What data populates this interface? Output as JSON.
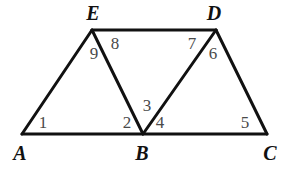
{
  "figure": {
    "background_color": "#ffffff",
    "stroke_color": "#111111",
    "stroke_width": 3,
    "vertex_label_color": "#111111",
    "angle_label_color": "#4a4a4a",
    "width": 285,
    "height": 172
  },
  "chart_data": {
    "type": "diagram",
    "shape": "two-triangles-trapezoid",
    "points": {
      "A": {
        "x": 22,
        "y": 134
      },
      "B": {
        "x": 143,
        "y": 134
      },
      "C": {
        "x": 267,
        "y": 134
      },
      "D": {
        "x": 216,
        "y": 30
      },
      "E": {
        "x": 92,
        "y": 30
      }
    },
    "segments": [
      {
        "name": "AC",
        "from": "A",
        "to": "C"
      },
      {
        "name": "ED",
        "from": "E",
        "to": "D"
      },
      {
        "name": "AE",
        "from": "A",
        "to": "E"
      },
      {
        "name": "EB",
        "from": "E",
        "to": "B"
      },
      {
        "name": "BD",
        "from": "B",
        "to": "D"
      },
      {
        "name": "DC",
        "from": "D",
        "to": "C"
      }
    ],
    "triangles": [
      {
        "name": "AEB",
        "vertices": [
          "A",
          "E",
          "B"
        ]
      },
      {
        "name": "BDC",
        "vertices": [
          "B",
          "D",
          "C"
        ]
      }
    ]
  },
  "vertices": [
    {
      "id": "A",
      "label": "A",
      "x": 20,
      "y": 153
    },
    {
      "id": "B",
      "label": "B",
      "x": 142,
      "y": 153
    },
    {
      "id": "C",
      "label": "C",
      "x": 270,
      "y": 153
    },
    {
      "id": "D",
      "label": "D",
      "x": 214,
      "y": 13
    },
    {
      "id": "E",
      "label": "E",
      "x": 93,
      "y": 13
    }
  ],
  "angles": [
    {
      "id": "1",
      "label": "1",
      "at_vertex": "A",
      "x": 43,
      "y": 122
    },
    {
      "id": "2",
      "label": "2",
      "at_vertex": "B",
      "x": 127,
      "y": 122
    },
    {
      "id": "3",
      "label": "3",
      "at_vertex": "B",
      "x": 147,
      "y": 105
    },
    {
      "id": "4",
      "label": "4",
      "at_vertex": "B",
      "x": 160,
      "y": 122
    },
    {
      "id": "5",
      "label": "5",
      "at_vertex": "C",
      "x": 245,
      "y": 122
    },
    {
      "id": "6",
      "label": "6",
      "at_vertex": "D",
      "x": 213,
      "y": 53
    },
    {
      "id": "7",
      "label": "7",
      "at_vertex": "D",
      "x": 192,
      "y": 43
    },
    {
      "id": "8",
      "label": "8",
      "at_vertex": "E",
      "x": 115,
      "y": 43
    },
    {
      "id": "9",
      "label": "9",
      "at_vertex": "E",
      "x": 94,
      "y": 53
    }
  ]
}
